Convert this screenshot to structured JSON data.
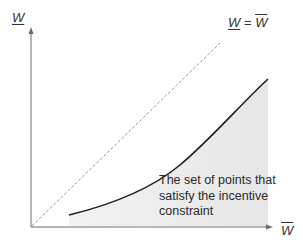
{
  "diagram": {
    "axes": {
      "y_label": "W",
      "y_label_style": "underline",
      "x_label": "W",
      "x_label_style": "overline"
    },
    "diagonal": {
      "label_left": "W",
      "label_equals": "=",
      "label_right": "W",
      "style": "dashed"
    },
    "region": {
      "lines": [
        "The set of points that",
        "satisfy the incentive",
        "constraint"
      ],
      "fill_color": "#ececec"
    },
    "colors": {
      "axis": "#666666",
      "curve": "#222222",
      "dashed": "#888888",
      "text": "#333333"
    }
  }
}
